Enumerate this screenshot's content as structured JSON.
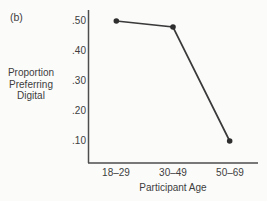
{
  "figure_label": "(b)",
  "chart_data": {
    "type": "line",
    "categories": [
      "18–29",
      "30–49",
      "50–69"
    ],
    "values": [
      0.5,
      0.48,
      0.1
    ],
    "xlabel": "Participant Age",
    "ylabel": "Proportion Preferring Digital",
    "ylabel_lines": [
      "Proportion",
      "Preferring",
      "Digital"
    ],
    "yticks": [
      0.5,
      0.4,
      0.3,
      0.2,
      0.1
    ],
    "ytick_labels": [
      ".50",
      ".40",
      ".30",
      ".20",
      ".10"
    ],
    "ylim": [
      0.03,
      0.535
    ],
    "grid": false,
    "marker": "filled-circle",
    "colors": {
      "line": "#3a3a3a",
      "marker": "#2e2e2e",
      "axis": "#4d4d4d",
      "text": "#3d3d3d",
      "background": "#fbfbfa"
    }
  }
}
